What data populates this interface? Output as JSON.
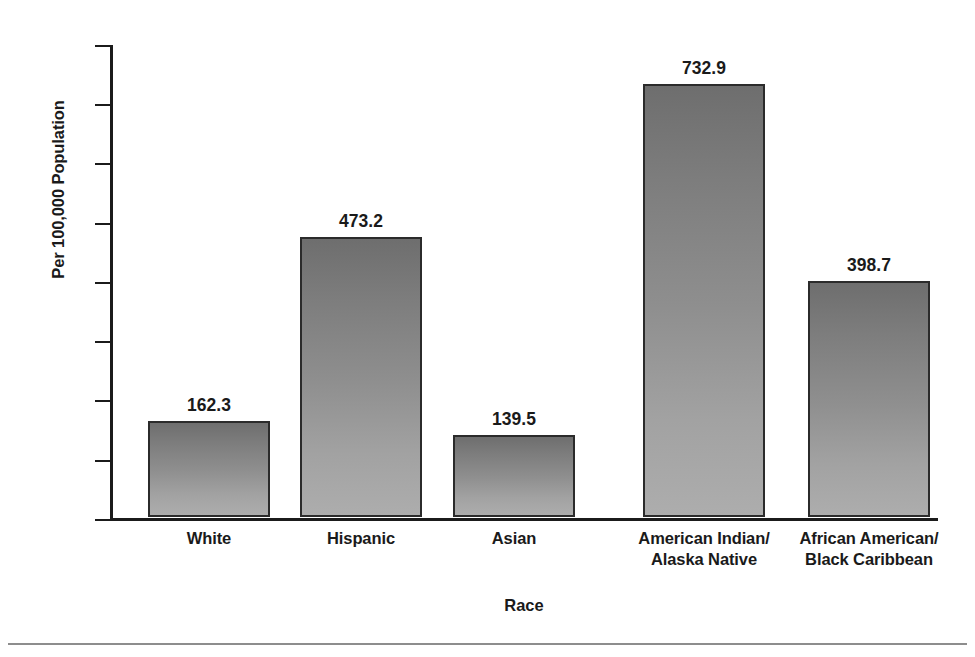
{
  "chart_data": {
    "type": "bar",
    "title": "",
    "subtitle": "",
    "xlabel": "Race",
    "ylabel": "Per 100,000 Population",
    "categories": [
      "White",
      "Hispanic",
      "Asian",
      "American Indian/\nAlaska Native",
      "African American/\nBlack Caribbean"
    ],
    "category_lines": [
      [
        "White"
      ],
      [
        "Hispanic"
      ],
      [
        "Asian"
      ],
      [
        "American Indian/",
        "Alaska Native"
      ],
      [
        "African American/",
        "Black Caribbean"
      ]
    ],
    "values": [
      162.3,
      473.2,
      139.5,
      732.9,
      398.7
    ],
    "value_labels": [
      "162.3",
      "473.2",
      "139.5",
      "732.9",
      "398.7"
    ],
    "ylim": [
      0,
      800
    ],
    "ytick_values": [
      0,
      100,
      200,
      300,
      400,
      500,
      600,
      700,
      800
    ],
    "ytick_labels": [
      "0",
      "100",
      "200",
      "300",
      "400",
      "500",
      "600",
      "700",
      "800"
    ],
    "grid": false,
    "legend": false,
    "legend_position": "none",
    "bar_fill_top_color": "#6e6e6e",
    "bar_fill_bottom_color": "#adadad",
    "bar_border_color": "#2b2b2b",
    "axis_color": "#1b1b1b",
    "background_color": "#ffffff",
    "text_color": "#1a1a1a"
  }
}
